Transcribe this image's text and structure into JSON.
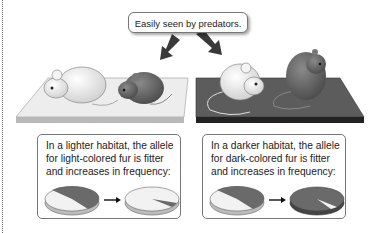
{
  "callout": {
    "text": "Easily seen by predators."
  },
  "habitats": [
    {
      "name": "lighter-habitat",
      "platform_color": "#e6e6e6",
      "caption_lines": [
        "In a lighter habitat, the allele",
        "for light-colored fur is fitter",
        "and increases in frequency:"
      ],
      "pie_before": {
        "light_fraction": 0.55,
        "dark_fraction": 0.45
      },
      "pie_after": {
        "light_fraction": 0.93,
        "dark_fraction": 0.07
      }
    },
    {
      "name": "darker-habitat",
      "platform_color": "#5a5a5a",
      "caption_lines": [
        "In a darker habitat, the allele",
        "for dark-colored fur is fitter",
        "and increases in frequency:"
      ],
      "pie_before": {
        "light_fraction": 0.55,
        "dark_fraction": 0.45
      },
      "pie_after": {
        "light_fraction": 0.07,
        "dark_fraction": 0.93
      }
    }
  ],
  "colors": {
    "light_fur": "#f2f2f2",
    "dark_fur": "#6a6a6a",
    "outline": "#555555"
  },
  "icons": [
    "arrow-down-left-icon",
    "arrow-down-right-icon",
    "right-arrow-icon"
  ]
}
